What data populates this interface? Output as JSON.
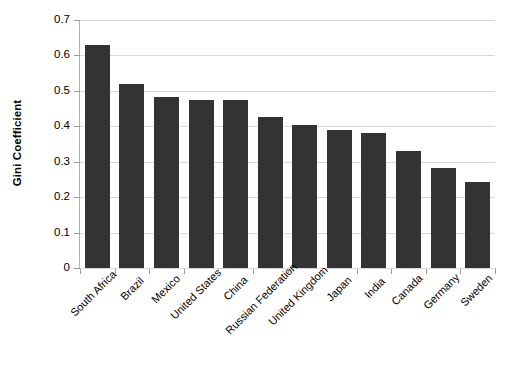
{
  "chart_data": {
    "type": "bar",
    "title": "",
    "xlabel": "",
    "ylabel": "Gini Coefficient",
    "ylim": [
      0,
      0.7
    ],
    "ytick_labels": [
      "0.7",
      "0.6",
      "0.5",
      "0.4",
      "0.3",
      "0.2",
      "0.1",
      "0"
    ],
    "ytick_values": [
      0.7,
      0.6,
      0.5,
      0.4,
      0.3,
      0.2,
      0.1,
      0
    ],
    "grid": true,
    "legend": false,
    "bar_color": "#333333",
    "gridline_color": "#d9d9d9",
    "axis_color": "#a8a8a8",
    "categories": [
      "South Africa",
      "Brazil",
      "Mexico",
      "United States",
      "China",
      "Russian Federation",
      "United Kingdom",
      "Japan",
      "India",
      "Canada",
      "Germany",
      "Sweden"
    ],
    "values": [
      0.63,
      0.52,
      0.483,
      0.475,
      0.474,
      0.425,
      0.405,
      0.39,
      0.38,
      0.33,
      0.283,
      0.243
    ]
  }
}
